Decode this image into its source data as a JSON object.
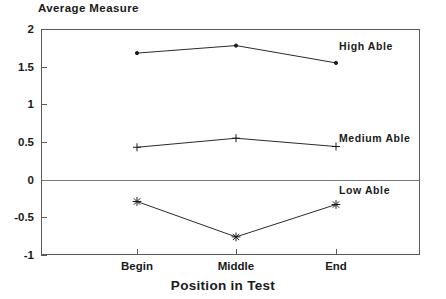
{
  "chart_data": {
    "type": "line",
    "title": "",
    "xlabel": "Position in Test",
    "ylabel": "Average Measure",
    "categories": [
      "Begin",
      "Middle",
      "End"
    ],
    "ylim": [
      -1,
      2
    ],
    "yticks": [
      2,
      1.5,
      1,
      0.5,
      0,
      -0.5,
      -1
    ],
    "ytick_labels": [
      "2",
      "1.5",
      "1",
      "0.5",
      "0",
      "-0.5",
      "-1"
    ],
    "grid": false,
    "legend_position": "inline-right",
    "zero_line": 0,
    "series": [
      {
        "name": "High Able",
        "marker": "dot",
        "values": [
          1.68,
          1.78,
          1.55
        ],
        "label_y": 1.78
      },
      {
        "name": "Medium Able",
        "marker": "plus",
        "values": [
          0.43,
          0.55,
          0.44
        ],
        "label_y": 0.55
      },
      {
        "name": "Low Able",
        "marker": "asterisk",
        "values": [
          -0.29,
          -0.76,
          -0.33
        ],
        "label_y": -0.14
      }
    ]
  },
  "colors": {
    "axis": "#5a5a5a",
    "line": "#2b2b2b",
    "text": "#1a1a1a",
    "background": "#ffffff"
  }
}
